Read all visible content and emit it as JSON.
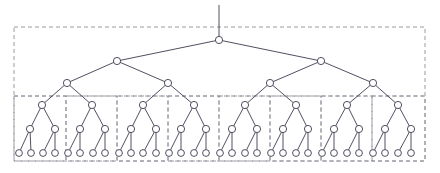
{
  "figure": {
    "type": "diagram",
    "diagram_kind": "tree-partition",
    "title": "",
    "caption": "",
    "background_color": "#ffffff",
    "node_stroke_color": "#3c3c50",
    "node_fill_color": "#ffffff",
    "edge_color": "#3c3c50",
    "partition_color": "#8e8e9a",
    "node_radius": 3.6,
    "leaf_radius": 3.4,
    "edge_width": 0.9,
    "partition_dash": "4,3"
  },
  "tree": {
    "description": "complete binary tree, depth 5",
    "depth": 5,
    "node_counts_by_level": [
      1,
      2,
      4,
      8,
      16,
      32
    ],
    "total_nodes": 63,
    "root_stub": {
      "x": 219,
      "y_top": 5,
      "y_bottom": 40
    },
    "levels": [
      {
        "level": 0,
        "y": 40,
        "nodes": [
          {
            "x": 219
          }
        ]
      },
      {
        "level": 1,
        "y": 61,
        "nodes": [
          {
            "x": 117
          },
          {
            "x": 321
          }
        ]
      },
      {
        "level": 2,
        "y": 83,
        "nodes": [
          {
            "x": 67
          },
          {
            "x": 168
          },
          {
            "x": 270
          },
          {
            "x": 373
          }
        ]
      },
      {
        "level": 3,
        "y": 105,
        "nodes": [
          {
            "x": 42
          },
          {
            "x": 92
          },
          {
            "x": 143
          },
          {
            "x": 194
          },
          {
            "x": 245
          },
          {
            "x": 296
          },
          {
            "x": 347
          },
          {
            "x": 398
          }
        ]
      },
      {
        "level": 4,
        "y": 129,
        "nodes": [
          {
            "x": 30
          },
          {
            "x": 55
          },
          {
            "x": 80
          },
          {
            "x": 105
          },
          {
            "x": 131
          },
          {
            "x": 156
          },
          {
            "x": 181
          },
          {
            "x": 206
          },
          {
            "x": 232
          },
          {
            "x": 257
          },
          {
            "x": 283
          },
          {
            "x": 308
          },
          {
            "x": 334
          },
          {
            "x": 359
          },
          {
            "x": 385
          },
          {
            "x": 411
          }
        ]
      },
      {
        "level": 5,
        "y": 153,
        "nodes": [
          {
            "x": 19
          },
          {
            "x": 31
          },
          {
            "x": 43
          },
          {
            "x": 55
          },
          {
            "x": 68
          },
          {
            "x": 80
          },
          {
            "x": 93
          },
          {
            "x": 105
          },
          {
            "x": 119
          },
          {
            "x": 131
          },
          {
            "x": 143
          },
          {
            "x": 156
          },
          {
            "x": 169
          },
          {
            "x": 181
          },
          {
            "x": 194
          },
          {
            "x": 206
          },
          {
            "x": 220
          },
          {
            "x": 232
          },
          {
            "x": 245
          },
          {
            "x": 257
          },
          {
            "x": 271
          },
          {
            "x": 283
          },
          {
            "x": 296
          },
          {
            "x": 308
          },
          {
            "x": 322
          },
          {
            "x": 334
          },
          {
            "x": 347
          },
          {
            "x": 359
          },
          {
            "x": 373
          },
          {
            "x": 385
          },
          {
            "x": 398
          },
          {
            "x": 411
          }
        ]
      }
    ]
  },
  "partitions": {
    "outer_box": {
      "x": 14,
      "y": 27,
      "width": 411,
      "height": 134
    },
    "upper_divider": {
      "x1": 14,
      "y1": 96,
      "x2": 425,
      "y2": 96
    },
    "leaf_boxes": [
      {
        "index": 1,
        "x": 14,
        "y": 96,
        "width": 52,
        "height": 65
      },
      {
        "index": 2,
        "x": 66,
        "y": 96,
        "width": 51,
        "height": 65
      },
      {
        "index": 3,
        "x": 117,
        "y": 96,
        "width": 51,
        "height": 65
      },
      {
        "index": 4,
        "x": 168,
        "y": 96,
        "width": 51,
        "height": 65
      },
      {
        "index": 5,
        "x": 219,
        "y": 96,
        "width": 51,
        "height": 65
      },
      {
        "index": 6,
        "x": 270,
        "y": 96,
        "width": 51,
        "height": 65
      },
      {
        "index": 7,
        "x": 321,
        "y": 96,
        "width": 51,
        "height": 65
      },
      {
        "index": 8,
        "x": 372,
        "y": 96,
        "width": 53,
        "height": 65
      }
    ]
  }
}
